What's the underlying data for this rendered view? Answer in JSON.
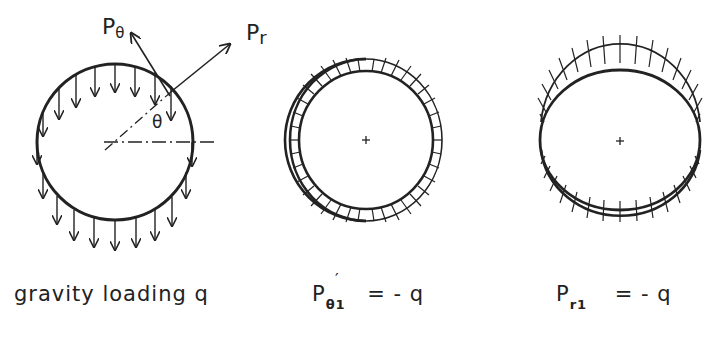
{
  "figure": {
    "panels": [
      {
        "id": "gravity",
        "caption": "gravity loading q",
        "labels": {
          "p_theta": "P",
          "p_theta_sub": "θ",
          "p_r": "P",
          "p_r_sub": "r",
          "theta": "θ"
        }
      },
      {
        "id": "p-theta-1",
        "caption_main": "P",
        "caption_sub": "θ1",
        "caption_prime": "′",
        "caption_rhs": "=  - q"
      },
      {
        "id": "p-r-1",
        "caption_main": "P",
        "caption_sub": "r1",
        "caption_rhs": "=  - q"
      }
    ],
    "colors": {
      "stroke": "#222222",
      "background": "#ffffff"
    }
  }
}
